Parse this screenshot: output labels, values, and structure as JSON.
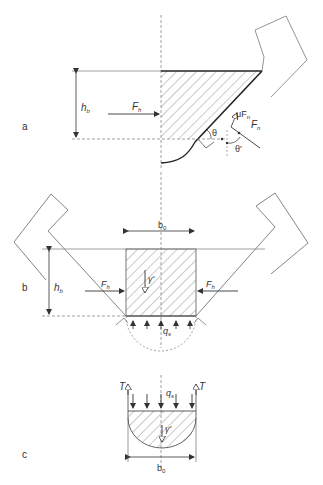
{
  "figure": {
    "panels": [
      {
        "id": "a",
        "label": "a",
        "height_label": "h",
        "height_sub": "b",
        "force_h": "F",
        "force_h_sub": "h",
        "force_n": "F",
        "force_n_sub": "n",
        "friction": "μF",
        "friction_sub": "n",
        "angle": "θ",
        "angle_prime": "θ'"
      },
      {
        "id": "b",
        "label": "b",
        "width_label": "b",
        "width_sub": "0",
        "height_label": "h",
        "height_sub": "b",
        "force_left": "F",
        "force_left_sub": "h",
        "force_right": "F",
        "force_right_sub": "h",
        "weight": "γ'",
        "pressure": "q",
        "pressure_sub": "s"
      },
      {
        "id": "c",
        "label": "c",
        "tension_left": "T",
        "tension_right": "T",
        "pressure": "q",
        "pressure_sub": "s",
        "weight": "γ'",
        "width_label": "b",
        "width_sub": "0"
      }
    ],
    "colors": {
      "line": "#333333",
      "hatch": "#777777",
      "thin": "#888888"
    }
  }
}
